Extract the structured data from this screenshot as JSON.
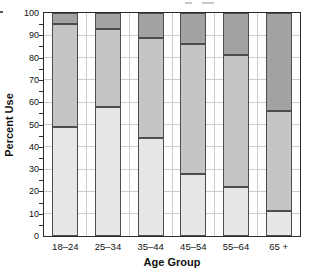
{
  "chart_data": {
    "type": "bar",
    "stacked": true,
    "title": "",
    "xlabel": "Age Group",
    "ylabel": "Percent Use",
    "categories": [
      "18–24",
      "25–34",
      "35–44",
      "45–54",
      "55–64",
      "65 +"
    ],
    "series": [
      {
        "name": "segment-bottom-light",
        "color": "#e7e7e7",
        "values": [
          49,
          58,
          44,
          28,
          22,
          11
        ]
      },
      {
        "name": "segment-middle-medium",
        "color": "#c5c5c5",
        "values": [
          46,
          35,
          45,
          58,
          59,
          45
        ]
      },
      {
        "name": "segment-top-dark",
        "color": "#a3a3a3",
        "values": [
          5,
          7,
          11,
          14,
          19,
          44
        ]
      }
    ],
    "ylim": [
      0,
      100
    ],
    "yticks": [
      0,
      10,
      20,
      30,
      40,
      50,
      60,
      70,
      80,
      90,
      100
    ],
    "minor_tick_step": 5,
    "grid": true,
    "legend": "none",
    "colors": {
      "grid": "#cccccc",
      "bar_outline": "#4d4d4d",
      "axis": "#2b2b2b",
      "text": "#111111"
    }
  }
}
